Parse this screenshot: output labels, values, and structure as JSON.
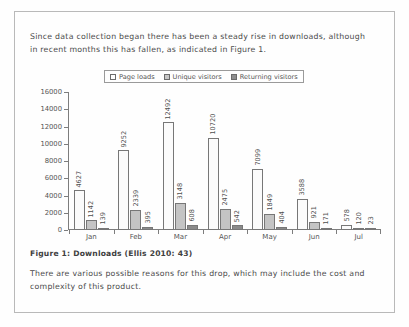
{
  "document": {
    "intro_paragraph": "Since data collection began there has been a steady rise in downloads, although in recent months this has fallen, as indicated in Figure 1.",
    "caption": "Figure 1:  Downloads (Ellis 2010: 43)",
    "closing_paragraph": "There are various possible reasons for this drop, which may include the cost and complexity of this product."
  },
  "chart_data": {
    "type": "bar",
    "title": "",
    "xlabel": "",
    "ylabel": "",
    "grid": false,
    "legend_position": "top",
    "categories": [
      "Jan",
      "Feb",
      "Mar",
      "Apr",
      "May",
      "Jun",
      "Jul"
    ],
    "ylim": [
      0,
      16000
    ],
    "yticks": [
      0,
      2000,
      4000,
      6000,
      8000,
      10000,
      12000,
      14000,
      16000
    ],
    "ytick_labels": [
      "0",
      "2000",
      "4000",
      "6000",
      "8000",
      "10000",
      "12000",
      "14000",
      "16000"
    ],
    "series": [
      {
        "name": "Page loads",
        "color": "#fbfbfb",
        "values": [
          4627,
          9252,
          12492,
          10720,
          7099,
          3588,
          578
        ]
      },
      {
        "name": "Unique visitors",
        "color": "#c4c4c4",
        "values": [
          1142,
          2339,
          3148,
          2475,
          1849,
          921,
          120
        ]
      },
      {
        "name": "Returning visitors",
        "color": "#8a8a8a",
        "values": [
          139,
          395,
          608,
          542,
          404,
          171,
          23
        ]
      }
    ]
  }
}
